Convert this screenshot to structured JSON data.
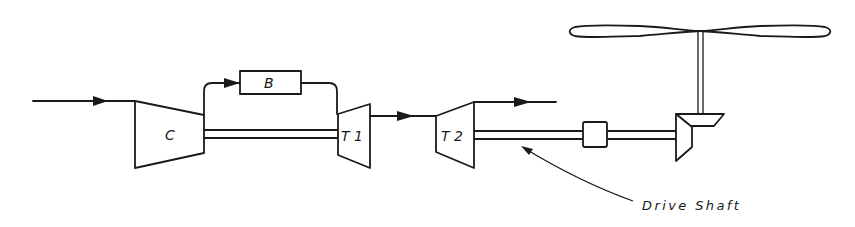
{
  "diagram": {
    "components": {
      "compressor": {
        "label": "C"
      },
      "burner": {
        "label": "B"
      },
      "turbine1": {
        "label": "T 1"
      },
      "turbine2": {
        "label": "T 2"
      },
      "coupling": {
        "label": ""
      },
      "gearbox": {
        "label": ""
      },
      "rotor": {
        "label": ""
      }
    },
    "annotations": {
      "drive_shaft": "Drive Shaft"
    },
    "colors": {
      "ink": "#1a1a1a",
      "background": "#ffffff"
    }
  }
}
